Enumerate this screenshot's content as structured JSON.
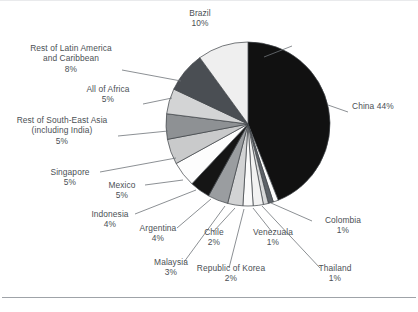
{
  "chart_data": {
    "type": "pie",
    "title": "",
    "subtitle": "",
    "xlabel": "",
    "ylabel": "",
    "legend_position": "none",
    "grid": false,
    "units": "percent",
    "start_angle_deg": 0,
    "direction": "clockwise",
    "categories": [
      "China",
      "Colombia",
      "Thailand",
      "Venezuala",
      "Republic of Korea",
      "Chile",
      "Malaysia",
      "Argentina",
      "Indonesia",
      "Mexico",
      "Singapore",
      "Rest of South-East Asia (including India)",
      "All of Africa",
      "Rest of Latin America and Caribbean",
      "Brazil"
    ],
    "values": [
      44,
      1,
      1,
      1,
      2,
      2,
      3,
      4,
      4,
      5,
      5,
      5,
      5,
      8,
      10
    ],
    "colors": [
      "#111111",
      "#fcfcfc",
      "#5d6268",
      "#d8d9da",
      "#f2f2f2",
      "#fbfbfb",
      "#d2d3d4",
      "#9a9da0",
      "#151515",
      "#fdfdfd",
      "#c9cacb",
      "#8e9194",
      "#d3d4d5",
      "#4a4e53",
      "#efefef"
    ],
    "total": 100,
    "slice_count": 15
  },
  "labels": [
    {
      "name": "brazil",
      "title": "Brazil",
      "percent": "10%"
    },
    {
      "name": "rest-of-latin-america-and-caribbean",
      "title_line1": "Rest of Latin America",
      "title_line2": "and Caribbean",
      "percent": "8%"
    },
    {
      "name": "all-of-africa",
      "title": "All of Africa",
      "percent": "5%"
    },
    {
      "name": "rest-of-south-east-asia",
      "title_line1": "Rest of South-East Asia",
      "title_line2": "(including India)",
      "percent": "5%"
    },
    {
      "name": "singapore",
      "title": "Singapore",
      "percent": "5%"
    },
    {
      "name": "mexico",
      "title": "Mexico",
      "percent": "5%"
    },
    {
      "name": "indonesia",
      "title": "Indonesia",
      "percent": "4%"
    },
    {
      "name": "argentina",
      "title": "Argentina",
      "percent": "4%"
    },
    {
      "name": "malaysia",
      "title": "Malaysia",
      "percent": "3%"
    },
    {
      "name": "chile",
      "title": "Chile",
      "percent": "2%"
    },
    {
      "name": "republic-of-korea",
      "title": "Republic of Korea",
      "percent": "2%"
    },
    {
      "name": "venezuala",
      "title": "Venezuala",
      "percent": "1%"
    },
    {
      "name": "thailand",
      "title": "Thailand",
      "percent": "1%"
    },
    {
      "name": "colombia",
      "title": "Colombia",
      "percent": "1%"
    },
    {
      "name": "china",
      "title": "China 44%",
      "percent": ""
    }
  ]
}
